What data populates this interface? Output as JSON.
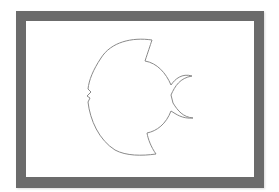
{
  "figure": {
    "frame_color": "#6b6b6b",
    "background_color": "#ffffff",
    "stroke_color": "#8a8a8a"
  }
}
